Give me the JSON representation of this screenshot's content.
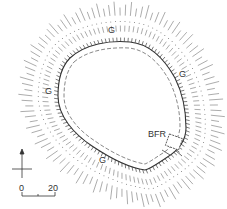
{
  "figure": {
    "type": "archaeological earthwork plan",
    "labels": {
      "g_north": "G",
      "g_east": "G",
      "g_west": "G",
      "g_south": "G",
      "feature": "BFR"
    },
    "north_arrow": {
      "direction": "north"
    },
    "scale_bar": {
      "start": "0",
      "end": "20"
    },
    "colors": {
      "ink": "#333333",
      "hachure": "#777777",
      "background": "#ffffff"
    }
  }
}
